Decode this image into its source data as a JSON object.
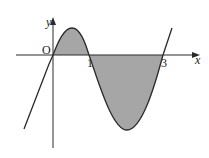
{
  "diagram": {
    "axes": {
      "x_label": "x",
      "y_label": "y",
      "origin_label": "O"
    },
    "x_intercepts": [
      {
        "label": "1",
        "value": 1
      },
      {
        "label": "3",
        "value": 3
      }
    ],
    "shaded_regions": [
      {
        "from": 0,
        "to": 1,
        "side": "above x-axis"
      },
      {
        "from": 1,
        "to": 3,
        "side": "below x-axis"
      }
    ],
    "colors": {
      "shade": "#a6a6a6",
      "curve": "#2a2a2a",
      "axis": "#2a2a2a"
    }
  }
}
